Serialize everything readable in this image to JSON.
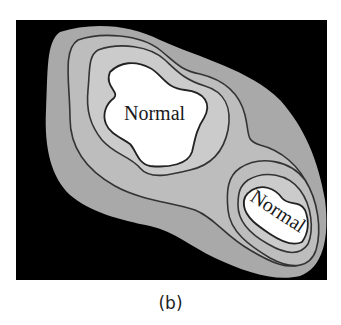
{
  "figure": {
    "caption": "(b)",
    "background_color": "#000000",
    "zones": [
      {
        "name": "outer",
        "color": "#a8a8a8"
      },
      {
        "name": "ring-2",
        "color": "#b9b9b9"
      },
      {
        "name": "ring-3",
        "color": "#cccccc"
      },
      {
        "name": "core",
        "color": "#ffffff"
      }
    ],
    "regions": [
      {
        "label": "Normal"
      },
      {
        "label": "Normal"
      }
    ]
  }
}
